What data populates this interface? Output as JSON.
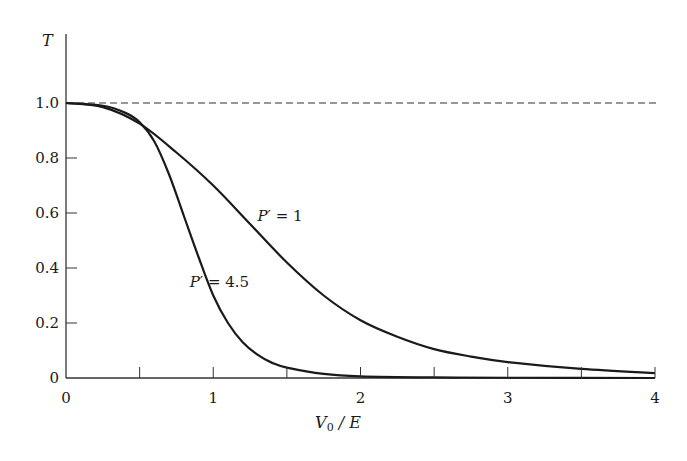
{
  "chart_data": {
    "type": "line",
    "title": "",
    "xlabel": "V0 / E",
    "ylabel": "T",
    "xlim": [
      0,
      4
    ],
    "ylim": [
      0,
      1.0
    ],
    "grid": false,
    "x_ticks": [
      0,
      0.5,
      1,
      1.5,
      2,
      2.5,
      3,
      3.5,
      4
    ],
    "x_tick_labels": [
      "0",
      "",
      "1",
      "",
      "2",
      "",
      "3",
      "",
      "4"
    ],
    "y_ticks": [
      0,
      0.2,
      0.4,
      0.6,
      0.8,
      1.0
    ],
    "y_tick_labels": [
      "0",
      "0.2",
      "0.4",
      "0.6",
      "0.8",
      "1.0"
    ],
    "reference_line": {
      "y": 1.0,
      "style": "dashed"
    },
    "series": [
      {
        "name": "P′ = 1",
        "label_prefix": "P",
        "label_suffix": "′ = 1",
        "x": [
          0,
          0.25,
          0.5,
          0.75,
          1.0,
          1.25,
          1.5,
          1.75,
          2.0,
          2.25,
          2.5,
          2.75,
          3.0,
          3.5,
          4.0
        ],
        "values": [
          1.0,
          0.985,
          0.925,
          0.82,
          0.7,
          0.56,
          0.42,
          0.3,
          0.21,
          0.15,
          0.105,
          0.078,
          0.058,
          0.033,
          0.018
        ],
        "label_pos": {
          "x": 1.3,
          "y": 0.57
        }
      },
      {
        "name": "P′ = 4.5",
        "label_prefix": "P",
        "label_suffix": "′ = 4.5",
        "x": [
          0,
          0.25,
          0.4,
          0.5,
          0.6,
          0.7,
          0.8,
          0.9,
          1.0,
          1.1,
          1.2,
          1.3,
          1.4,
          1.5,
          1.75,
          2.0,
          2.5,
          3.0,
          4.0
        ],
        "values": [
          1.0,
          0.99,
          0.965,
          0.93,
          0.86,
          0.74,
          0.59,
          0.44,
          0.3,
          0.2,
          0.13,
          0.085,
          0.055,
          0.038,
          0.015,
          0.006,
          0.002,
          0.001,
          0.0
        ],
        "label_pos": {
          "x": 0.84,
          "y": 0.33
        }
      }
    ]
  }
}
